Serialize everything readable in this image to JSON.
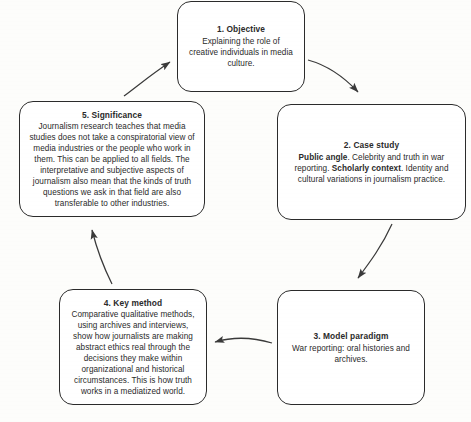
{
  "diagram": {
    "type": "cycle",
    "background_color": "#fdfdfb",
    "box_border_color": "#2b2b2b",
    "text_color": "#2a2a2a",
    "arrow_color": "#3a3a3a",
    "nodes": [
      {
        "id": "node1",
        "title": "1. Objective",
        "body_plain": "Explaining the role of creative individuals in media culture.",
        "body_html": "Explaining the role of creative individuals in media culture."
      },
      {
        "id": "node2",
        "title": "2. Case study",
        "body_plain": "Public angle. Celebrity and truth in war reporting. Scholarly context. Identity and cultural variations in journalism practice.",
        "body_html": "<b>Public angle</b>. Celebrity and truth in war reporting. <b>Scholarly context</b>. Identity and cultural variations in journalism practice."
      },
      {
        "id": "node3",
        "title": "3. Model paradigm",
        "body_plain": "War reporting: oral histories and archives.",
        "body_html": "War reporting: oral histories and archives."
      },
      {
        "id": "node4",
        "title": "4. Key method",
        "body_plain": "Comparative qualitative methods, using archives and interviews, show how journalists are making abstract ethics real through the decisions they make within organizational and historical circumstances. This is how truth works in a mediatized world.",
        "body_html": "Comparative qualitative methods, using archives and interviews, show how journalists are making abstract ethics real through the decisions they make within organizational and historical circumstances. This is how truth works in a mediatized world."
      },
      {
        "id": "node5",
        "title": "5. Significance",
        "body_plain": "Journalism research teaches that media studies does not take a conspiratorial view of media industries or the people who work in them. This can be applied to all fields. The interpretative and subjective aspects of journalism also mean that the kinds of truth questions we ask in that field are also transferable to other industries.",
        "body_html": "Journalism research teaches that media studies does not take a conspiratorial view of media industries or the people who work in them. This can be applied to all fields. The interpretative and subjective aspects of journalism also mean that the kinds of truth questions we ask in that field are also transferable to other industries."
      }
    ],
    "edges": [
      {
        "from": "node1",
        "to": "node2",
        "label": ""
      },
      {
        "from": "node2",
        "to": "node3",
        "label": ""
      },
      {
        "from": "node3",
        "to": "node4",
        "label": ""
      },
      {
        "from": "node4",
        "to": "node5",
        "label": ""
      },
      {
        "from": "node5",
        "to": "node1",
        "label": ""
      }
    ]
  }
}
